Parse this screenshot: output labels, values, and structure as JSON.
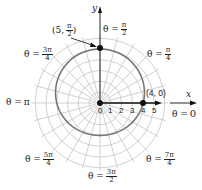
{
  "chart_data": {
    "type": "polar",
    "equation_shape": "r = 4 + sin(theta) (limacon-like closed curve)",
    "curve_points": [
      {
        "label": "(5, π/2)",
        "r": 5,
        "theta": "π/2"
      },
      {
        "label": "(4, 0)",
        "r": 4,
        "theta": "0"
      }
    ],
    "radial_ticks": [
      "0",
      "1",
      "2",
      "3",
      "4",
      "5"
    ],
    "angle_labels": [
      {
        "id": "t0",
        "text": "θ = 0",
        "num": "0",
        "den": ""
      },
      {
        "id": "t1",
        "text": "θ = π/4",
        "num": "π",
        "den": "4"
      },
      {
        "id": "t2",
        "text": "θ = π/2",
        "num": "π",
        "den": "2"
      },
      {
        "id": "t3",
        "text": "θ = 3π/4",
        "num": "3π",
        "den": "4"
      },
      {
        "id": "t4",
        "text": "θ = π",
        "num": "π",
        "den": ""
      },
      {
        "id": "t5",
        "text": "θ = 5π/4",
        "num": "5π",
        "den": "4"
      },
      {
        "id": "t6",
        "text": "θ = 3π/2",
        "num": "3π",
        "den": "2"
      },
      {
        "id": "t7",
        "text": "θ = 7π/4",
        "num": "7π",
        "den": "4"
      }
    ],
    "axes": {
      "x": "x",
      "y": "y"
    },
    "grid": {
      "circles": [
        1,
        2,
        3,
        4,
        5,
        6
      ],
      "radial_step_deg": 15
    },
    "colors": {
      "curve": "#777777",
      "grid": "#bdbdbd",
      "axis": "#111111",
      "point": "#111111"
    }
  },
  "labels": {
    "theta_eq": "θ =",
    "pi": "π",
    "zero": "0",
    "point_top": {
      "pre": "(5, ",
      "num": "π",
      "den": "2",
      "post": ")"
    },
    "point_right": "(4, 0)",
    "x_axis": "x",
    "y_axis": "y",
    "ticks": [
      "0",
      "1",
      "2",
      "3",
      "4",
      "5"
    ]
  }
}
